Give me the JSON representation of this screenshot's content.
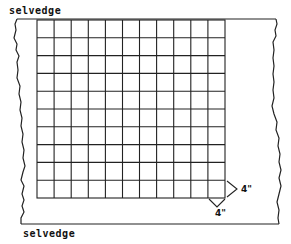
{
  "labels": {
    "top_selvedge": "selvedge",
    "bottom_selvedge": "selvedge"
  },
  "grid": {
    "columns": 11,
    "rows": 10,
    "line_color": "#222222"
  },
  "dimensions": {
    "square_width": "4\"",
    "square_height": "4\""
  },
  "colors": {
    "background": "#ffffff",
    "ink": "#222222"
  }
}
